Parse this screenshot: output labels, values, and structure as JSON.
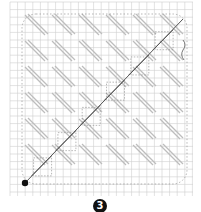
{
  "figure": {
    "step_label": "3",
    "grid": {
      "x0": 10,
      "y0": 2,
      "x1": 193,
      "y1": 196,
      "cell": 7.6,
      "color": "#cfcfcf"
    },
    "colors": {
      "stitch": "#bdbdbd",
      "working_thread": "#555555",
      "dotted": "#888888",
      "start_dot": "#111111"
    },
    "start_point": {
      "x": 25,
      "y": 183
    },
    "end_point": {
      "x": 183,
      "y": 19
    }
  }
}
